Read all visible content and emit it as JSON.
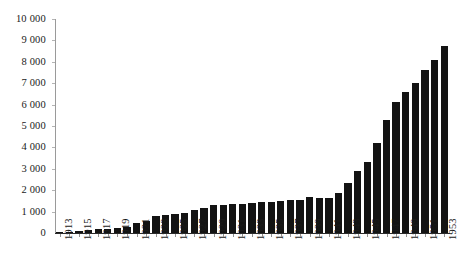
{
  "chart_data": {
    "type": "bar",
    "title": "",
    "subtitle": "",
    "xlabel": "",
    "ylabel": "",
    "ylim": [
      0,
      10000
    ],
    "ytick_step": 1000,
    "ytick_labels": [
      "10 000",
      "9 000",
      "8 000",
      "7 000",
      "6 000",
      "5 000",
      "4 000",
      "3 000",
      "2 000",
      "1 000",
      "0"
    ],
    "ytick_values": [
      10000,
      9000,
      8000,
      7000,
      6000,
      5000,
      4000,
      3000,
      2000,
      1000,
      0
    ],
    "grid": false,
    "legend": null,
    "legend_position": "none",
    "thousands_separator": " ",
    "xtick_label_rotation": -90,
    "xtick_label_interval": 2,
    "bar_color": "#131313",
    "axis_color": "#9a9a9a",
    "categories": [
      "1913",
      "1914",
      "1915",
      "1916",
      "1917",
      "1918",
      "1919",
      "1920",
      "1921",
      "1922",
      "1923",
      "1924",
      "1925",
      "1926",
      "1927",
      "1928",
      "1929",
      "1930",
      "1931",
      "1932",
      "1933",
      "1934",
      "1935",
      "1936",
      "1937",
      "1938",
      "1939",
      "1940",
      "1941",
      "1942",
      "1943",
      "1944",
      "1945",
      "1946",
      "1947",
      "1948",
      "1949",
      "1950",
      "1951",
      "1952",
      "1953"
    ],
    "tick_categories": [
      "1913",
      "1915",
      "1917",
      "1919",
      "1921",
      "1923",
      "1925",
      "1927",
      "1929",
      "1931",
      "1933",
      "1935",
      "1937",
      "1939",
      "1941",
      "1943",
      "1945",
      "1947",
      "1949",
      "1951",
      "1953"
    ],
    "values": [
      60,
      60,
      90,
      130,
      170,
      190,
      230,
      300,
      480,
      560,
      790,
      830,
      880,
      940,
      1060,
      1170,
      1300,
      1330,
      1350,
      1340,
      1400,
      1430,
      1450,
      1480,
      1520,
      1560,
      1700,
      1620,
      1650,
      1880,
      2350,
      2900,
      3300,
      4200,
      5300,
      6100,
      6600,
      7000,
      7600,
      8100,
      8740
    ]
  }
}
